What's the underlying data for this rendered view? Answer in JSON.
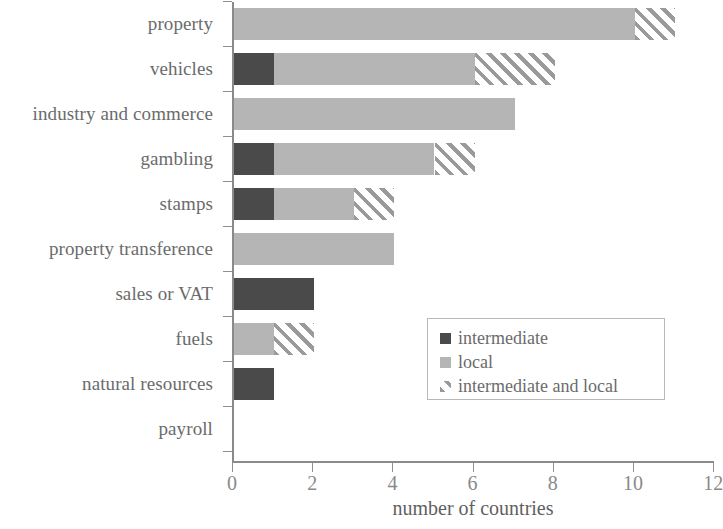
{
  "chart_data": {
    "type": "bar",
    "orientation": "horizontal",
    "stacked": true,
    "title": "",
    "xlabel": "number of countries",
    "ylabel": "",
    "xlim": [
      0,
      12
    ],
    "xticks": [
      0,
      2,
      4,
      6,
      8,
      10,
      12
    ],
    "xtick_labels": [
      "0",
      "2",
      "4",
      "6",
      "8",
      "10",
      "12"
    ],
    "grid": false,
    "legend_position": "center-right-inside",
    "categories": [
      "property",
      "vehicles",
      "industry and commerce",
      "gambling",
      "stamps",
      "property transference",
      "sales or VAT",
      "fuels",
      "natural resources",
      "payroll"
    ],
    "series": [
      {
        "name": "intermediate",
        "color": "#4a4a4a",
        "values": [
          0,
          1,
          0,
          1,
          1,
          0,
          2,
          0,
          1,
          0
        ]
      },
      {
        "name": "local",
        "color": "#b5b5b5",
        "values": [
          10,
          5,
          7,
          4,
          2,
          4,
          0,
          1,
          0,
          0
        ]
      },
      {
        "name": "intermediate and local",
        "color": "#9a9a9a",
        "pattern": "diagonal-hatch",
        "values": [
          1,
          2,
          0,
          1,
          1,
          0,
          0,
          1,
          0,
          0
        ]
      }
    ],
    "totals": [
      11,
      8,
      7,
      6,
      4,
      4,
      2,
      2,
      1,
      0
    ]
  },
  "legend": {
    "items": [
      {
        "label": "intermediate"
      },
      {
        "label": "local"
      },
      {
        "label": "intermediate and local"
      }
    ]
  }
}
